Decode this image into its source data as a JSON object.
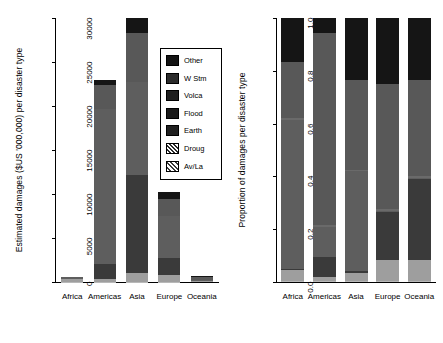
{
  "chart_data": [
    {
      "type": "bar",
      "id": "absolute-damages",
      "title": "",
      "xlabel": "",
      "ylabel": "Estimated damages ($US '000,000) per disaster type",
      "ylim": [
        0,
        30000
      ],
      "yticks": [
        "0",
        "5000",
        "10000",
        "15000",
        "20000",
        "25000",
        "30000"
      ],
      "ytick_values": [
        0,
        5000,
        10000,
        15000,
        20000,
        25000,
        30000
      ],
      "grid": false,
      "stacked": true,
      "legend_position": "inside-right",
      "categories": [
        "Africa",
        "Americas",
        "Asia",
        "Europe",
        "Oceania"
      ],
      "series": [
        {
          "name": "Av/La",
          "values": [
            10,
            20,
            40,
            30,
            5
          ]
        },
        {
          "name": "Droug",
          "values": [
            330,
            300,
            950,
            820,
            60
          ]
        },
        {
          "name": "Earth",
          "values": [
            40,
            1700,
            11200,
            1900,
            20
          ]
        },
        {
          "name": "Flood",
          "values": [
            140,
            17600,
            10500,
            4700,
            120
          ]
        },
        {
          "name": "Volca",
          "values": [
            5,
            30,
            60,
            40,
            5
          ]
        },
        {
          "name": "W Stm",
          "values": [
            60,
            2800,
            5600,
            2000,
            420
          ]
        },
        {
          "name": "Other",
          "values": [
            15,
            550,
            1650,
            700,
            70
          ]
        }
      ],
      "totals": [
        600,
        23000,
        30000,
        10190,
        700
      ]
    },
    {
      "type": "bar",
      "id": "proportional-damages",
      "title": "",
      "xlabel": "",
      "ylabel": "Proportion of damages per disaster type",
      "ylim": [
        0,
        1
      ],
      "yticks": [
        "0.0",
        "0.2",
        "0.4",
        "0.6",
        "0.8",
        "1.0"
      ],
      "ytick_values": [
        0.0,
        0.2,
        0.4,
        0.6,
        0.8,
        1.0
      ],
      "grid": false,
      "stacked": true,
      "normalized": true,
      "categories": [
        "Africa",
        "Americas",
        "Asia",
        "Europe",
        "Oceania"
      ],
      "series": [
        {
          "name": "Av/La",
          "values": [
            0.005,
            0.005,
            0.005,
            0.005,
            0.005
          ]
        },
        {
          "name": "Droug",
          "values": [
            0.04,
            0.015,
            0.03,
            0.08,
            0.08
          ]
        },
        {
          "name": "Earth",
          "values": [
            0.005,
            0.075,
            0.005,
            0.18,
            0.305
          ]
        },
        {
          "name": "Flood",
          "values": [
            0.565,
            0.115,
            0.38,
            0.005,
            0.005
          ]
        },
        {
          "name": "Volca",
          "values": [
            0.005,
            0.005,
            0.005,
            0.005,
            0.005
          ]
        },
        {
          "name": "W Stm",
          "values": [
            0.215,
            0.73,
            0.34,
            0.475,
            0.365
          ]
        },
        {
          "name": "Other",
          "values": [
            0.165,
            0.055,
            0.235,
            0.25,
            0.235
          ]
        }
      ]
    }
  ],
  "legend": {
    "items": [
      {
        "label": "Other",
        "swatch": "solid",
        "color": "#141414"
      },
      {
        "label": "W Stm",
        "swatch": "solid",
        "color": "#2b2b2b"
      },
      {
        "label": "Volca",
        "swatch": "solid",
        "color": "#1f1f1f"
      },
      {
        "label": "Flood",
        "swatch": "solid",
        "color": "#1a1a1a"
      },
      {
        "label": "Earth",
        "swatch": "solid",
        "color": "#202020"
      },
      {
        "label": "Droug",
        "swatch": "hatch",
        "color": "#9a9a9a"
      },
      {
        "label": "Av/La",
        "swatch": "cross",
        "color": "#c4c4c4"
      }
    ]
  },
  "palette": {
    "Av/La": "#b8b8b8",
    "Droug": "#9e9e9e",
    "Earth": "#3a3a3a",
    "Flood": "#5e5e5e",
    "Volca": "#6a6a6a",
    "W Stm": "#585858",
    "Other": "#151515",
    "axis": "#000000",
    "background": "#ffffff"
  },
  "left_panel": {
    "axis_title": "Estimated damages ($US '000,000) per disaster type",
    "tick_labels": [
      "0",
      "5000",
      "10000",
      "15000",
      "20000",
      "25000",
      "30000"
    ],
    "category_labels": [
      "Africa",
      "Americas",
      "Asia",
      "Europe",
      "Oceania"
    ]
  },
  "right_panel": {
    "axis_title": "Proportion of damages per disaster type",
    "tick_labels": [
      "0.0",
      "0.2",
      "0.4",
      "0.6",
      "0.8",
      "1.0"
    ],
    "category_labels": [
      "Africa",
      "Americas",
      "Asia",
      "Europe",
      "Oceania"
    ]
  }
}
